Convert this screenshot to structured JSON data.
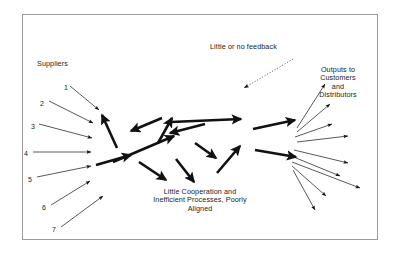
{
  "diagram": {
    "frame": {
      "border_color": "#9b9b9b",
      "background": "#ffffff"
    },
    "stroke_color": "#111111",
    "labels": {
      "suppliers": "Suppliers",
      "feedback": "Little or no feedback",
      "outputs": "Outputs to\nCustomers\nand\nDistributors",
      "center": "Little Cooperation and\nInefficient Processes, Poorly\nAligned"
    },
    "supplier_numbers": [
      {
        "text": "1",
        "x": 64,
        "y": 84
      },
      {
        "text": "2",
        "x": 40,
        "y": 100
      },
      {
        "text": "3",
        "x": 31,
        "y": 123
      },
      {
        "text": "4",
        "x": 24,
        "y": 150
      },
      {
        "text": "5",
        "x": 28,
        "y": 176
      },
      {
        "text": "6",
        "x": 42,
        "y": 204
      },
      {
        "text": "7",
        "x": 52,
        "y": 226
      }
    ],
    "input_arrows": [
      {
        "x1": 70,
        "y1": 86,
        "x2": 99,
        "y2": 110
      },
      {
        "x1": 49,
        "y1": 101,
        "x2": 93,
        "y2": 123
      },
      {
        "x1": 39,
        "y1": 124,
        "x2": 92,
        "y2": 138
      },
      {
        "x1": 33,
        "y1": 152,
        "x2": 91,
        "y2": 152
      },
      {
        "x1": 37,
        "y1": 177,
        "x2": 91,
        "y2": 166
      },
      {
        "x1": 51,
        "y1": 205,
        "x2": 90,
        "y2": 181
      },
      {
        "x1": 61,
        "y1": 227,
        "x2": 103,
        "y2": 196
      }
    ],
    "process_arrows": [
      {
        "x1": 117,
        "y1": 148,
        "x2": 102,
        "y2": 115
      },
      {
        "x1": 162,
        "y1": 118,
        "x2": 131,
        "y2": 131
      },
      {
        "x1": 96,
        "y1": 165,
        "x2": 131,
        "y2": 155
      },
      {
        "x1": 113,
        "y1": 162,
        "x2": 174,
        "y2": 136
      },
      {
        "x1": 158,
        "y1": 143,
        "x2": 172,
        "y2": 118
      },
      {
        "x1": 205,
        "y1": 124,
        "x2": 170,
        "y2": 133
      },
      {
        "x1": 171,
        "y1": 122,
        "x2": 241,
        "y2": 119
      },
      {
        "x1": 139,
        "y1": 162,
        "x2": 166,
        "y2": 180
      },
      {
        "x1": 176,
        "y1": 159,
        "x2": 194,
        "y2": 182
      },
      {
        "x1": 195,
        "y1": 143,
        "x2": 216,
        "y2": 158
      },
      {
        "x1": 217,
        "y1": 173,
        "x2": 240,
        "y2": 146
      },
      {
        "x1": 253,
        "y1": 129,
        "x2": 295,
        "y2": 120
      },
      {
        "x1": 255,
        "y1": 150,
        "x2": 296,
        "y2": 157
      }
    ],
    "output_arrows": [
      {
        "x1": 297,
        "y1": 128,
        "x2": 325,
        "y2": 84
      },
      {
        "x1": 297,
        "y1": 132,
        "x2": 330,
        "y2": 104
      },
      {
        "x1": 295,
        "y1": 137,
        "x2": 332,
        "y2": 124
      },
      {
        "x1": 297,
        "y1": 142,
        "x2": 348,
        "y2": 136
      },
      {
        "x1": 294,
        "y1": 150,
        "x2": 348,
        "y2": 163
      },
      {
        "x1": 296,
        "y1": 158,
        "x2": 340,
        "y2": 176
      },
      {
        "x1": 292,
        "y1": 162,
        "x2": 360,
        "y2": 188
      },
      {
        "x1": 292,
        "y1": 166,
        "x2": 326,
        "y2": 196
      },
      {
        "x1": 293,
        "y1": 170,
        "x2": 315,
        "y2": 210
      }
    ],
    "feedback_arrow": {
      "x1": 293,
      "y1": 59,
      "x2": 244,
      "y2": 88,
      "style": "dotted"
    }
  }
}
